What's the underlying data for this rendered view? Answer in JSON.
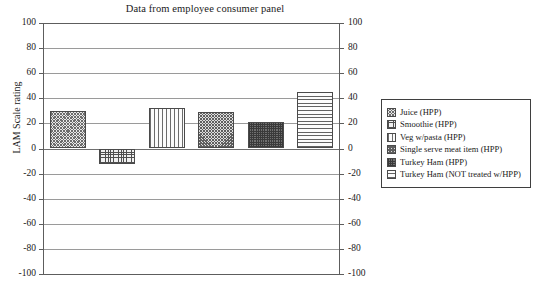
{
  "chart_data": {
    "type": "bar",
    "title": "Data from employee consumer panel",
    "xlabel": "",
    "ylabel": "LAM Scale rating",
    "ylim": [
      -100,
      100
    ],
    "yticks": [
      100,
      80,
      60,
      40,
      20,
      0,
      -20,
      -40,
      -60,
      -80,
      -100
    ],
    "grid": true,
    "dual_axis": true,
    "legend_position": "right",
    "categories": [
      "Juice (HPP)",
      "Smoothie (HPP)",
      "Veg w/pasta (HPP)",
      "Single serve meat item (HPP)",
      "Turkey Ham (HPP)",
      "Turkey Ham (NOT treated w/HPP)"
    ],
    "values": [
      30,
      -12,
      32,
      29,
      21,
      45
    ]
  },
  "legend": {
    "items": [
      {
        "label": "Juice (HPP)",
        "pattern": "diagonal-crosshatch"
      },
      {
        "label": "Smoothie (HPP)",
        "pattern": "grid-mesh"
      },
      {
        "label": "Veg w/pasta (HPP)",
        "pattern": "vertical-stripes"
      },
      {
        "label": "Single serve meat item (HPP)",
        "pattern": "dense-speckle"
      },
      {
        "label": "Turkey Ham (HPP)",
        "pattern": "dark-dotted"
      },
      {
        "label": "Turkey Ham (NOT treated w/HPP)",
        "pattern": "horizontal-stripes"
      }
    ]
  },
  "axis": {
    "left_ticks": [
      "100",
      "80",
      "60",
      "40",
      "20",
      "0",
      "-20",
      "-40",
      "-60",
      "-80",
      "-100"
    ],
    "right_ticks": [
      "100",
      "80",
      "60",
      "40",
      "20",
      "0",
      "-20",
      "-40",
      "-60",
      "-80",
      "-100"
    ]
  }
}
